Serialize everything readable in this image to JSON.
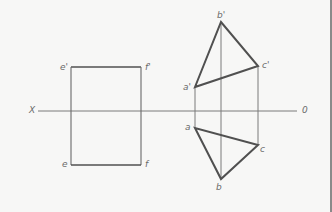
{
  "diagram": {
    "type": "orthographic-projection",
    "colors": {
      "background": "#f7f7f6",
      "thick_line": "#505050",
      "thin_line": "#7a7a7a",
      "label": "#6a6a6a"
    },
    "axis": {
      "left_label": "X",
      "right_label": "0",
      "y": 111,
      "x1": 38,
      "x2": 297
    },
    "rectangle": {
      "labels": {
        "top_left": "e'",
        "top_right": "f'",
        "bottom_left": "e",
        "bottom_right": "f"
      },
      "x1": 71,
      "x2": 141,
      "y1": 67,
      "y2": 165
    },
    "triangle_front": {
      "points": {
        "a_prime": [
          195,
          87
        ],
        "b_prime": [
          221,
          22
        ],
        "c_prime": [
          258,
          66
        ]
      },
      "labels": {
        "a_prime": "a'",
        "b_prime": "b'",
        "c_prime": "c'"
      }
    },
    "triangle_top": {
      "points": {
        "a": [
          195,
          128
        ],
        "b": [
          221,
          179
        ],
        "c": [
          258,
          145
        ]
      },
      "labels": {
        "a": "a",
        "b": "b",
        "c": "c"
      }
    }
  }
}
